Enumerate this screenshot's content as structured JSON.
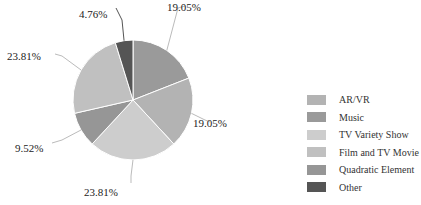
{
  "chart_data": {
    "type": "pie",
    "title": "",
    "categories": [
      "AR/VR",
      "Music",
      "TV Variety Show",
      "Film and TV Movie",
      "Quadratic Element",
      "Other"
    ],
    "values": [
      19.05,
      19.05,
      23.81,
      23.81,
      9.52,
      4.76
    ],
    "colors": [
      "#b3b3b3",
      "#9a9a9a",
      "#cdcdcd",
      "#c0c0c0",
      "#969696",
      "#555555"
    ],
    "slice_order_clockwise_from_top": [
      "Music",
      "AR/VR",
      "TV Variety Show",
      "Quadratic Element",
      "Film and TV Movie",
      "Other"
    ],
    "legend_position": "right",
    "label_format": "percent"
  },
  "labels": {
    "music": "19.05%",
    "arvr": "19.05%",
    "tv_variety": "23.81%",
    "quadratic": "9.52%",
    "film": "23.81%",
    "other": "4.76%"
  },
  "legend": [
    {
      "label": "AR/VR",
      "color": "#b3b3b3"
    },
    {
      "label": "Music",
      "color": "#9a9a9a"
    },
    {
      "label": "TV Variety Show",
      "color": "#cdcdcd"
    },
    {
      "label": "Film and TV Movie",
      "color": "#c0c0c0"
    },
    {
      "label": "Quadratic Element",
      "color": "#969696"
    },
    {
      "label": "Other",
      "color": "#555555"
    }
  ]
}
